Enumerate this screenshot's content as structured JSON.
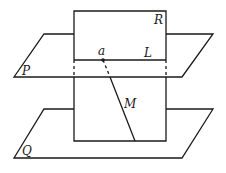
{
  "diagram": {
    "type": "geometry-planes",
    "labels": {
      "plane_r": "R",
      "plane_p": "P",
      "plane_q": "Q",
      "line_l": "L",
      "line_m": "M",
      "point_a": "a"
    },
    "colors": {
      "stroke": "#1a1a1a",
      "background": "#ffffff"
    }
  }
}
